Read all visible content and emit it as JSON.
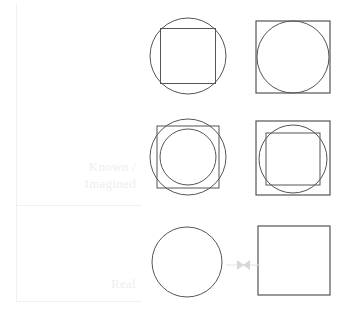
{
  "figure": {
    "title": "",
    "background_color": "#ffffff",
    "stroke_color": "#555555",
    "axis_color": "#f0f0f0",
    "label_color": "#eeeeee"
  },
  "axes": {
    "vertical_axis": "vertical-axis-line",
    "row_dividers": [
      "divider-mid",
      "divider-bottom"
    ]
  },
  "row_labels": [
    {
      "id": "known-imagined",
      "line1": "Known /",
      "line2": "Imagined"
    },
    {
      "id": "real",
      "line1": "Real"
    }
  ],
  "rows": [
    {
      "id": "row-1",
      "label_ref": "known-imagined",
      "cells": [
        {
          "id": "r1c1",
          "description": "circle with inscribed square",
          "shapes": [
            "circle",
            "square"
          ]
        },
        {
          "id": "r1c2",
          "description": "square with inscribed circle",
          "shapes": [
            "square",
            "circle"
          ]
        }
      ]
    },
    {
      "id": "row-2",
      "label_ref": "known-imagined",
      "cells": [
        {
          "id": "r2c1",
          "description": "circle containing square containing circle",
          "shapes": [
            "circle",
            "square",
            "circle"
          ]
        },
        {
          "id": "r2c2",
          "description": "square containing circle containing square",
          "shapes": [
            "square",
            "circle",
            "square"
          ]
        }
      ]
    },
    {
      "id": "row-3",
      "label_ref": "real",
      "cells": [
        {
          "id": "r3c1",
          "description": "plain circle",
          "shapes": [
            "circle"
          ]
        },
        {
          "id": "r3c2",
          "description": "plain square",
          "shapes": [
            "square"
          ]
        }
      ],
      "connector": {
        "id": "bowtie-connector",
        "type": "double-headed-inward-arrow",
        "color": "#dddddd"
      }
    }
  ]
}
